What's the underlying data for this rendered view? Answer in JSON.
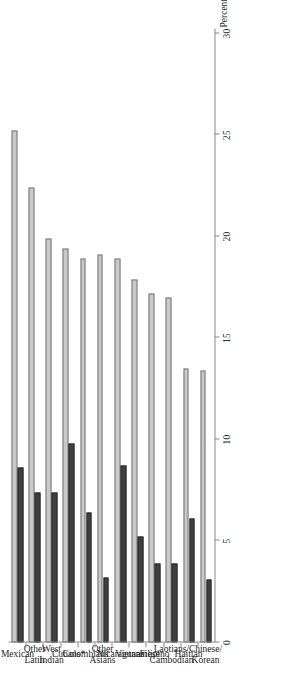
{
  "chart_data": {
    "type": "bar",
    "title": "",
    "xlabel": "",
    "ylabel": "Percent",
    "ylim": [
      0,
      30
    ],
    "yticks": [
      0,
      5,
      10,
      15,
      20,
      25,
      30
    ],
    "ytick_labels": [
      "0",
      "5",
      "10",
      "15",
      "20",
      "25",
      "30"
    ],
    "grid": false,
    "legend": "none",
    "orientation": "rotated-90-page-scan",
    "categories": [
      "Mexican",
      "Other\nLatin",
      "West\nIndian",
      "Cubans*",
      "Colombians",
      "Other\nAsians",
      "Nicaraguans",
      "Vietnamese",
      "Filipino",
      "Laotians/\nCambodian",
      "Haitian",
      "Chinese/\nKorean"
    ],
    "series": [
      {
        "name": "series-1",
        "color": "#c9c9c9",
        "values": [
          25.2,
          22.4,
          19.9,
          19.4,
          18.9,
          19.1,
          18.9,
          17.9,
          17.2,
          17.0,
          13.5,
          13.4
        ]
      },
      {
        "name": "series-2",
        "color": "#3f3f3f",
        "values": [
          8.6,
          7.4,
          7.4,
          9.8,
          6.4,
          3.2,
          8.7,
          5.2,
          3.9,
          3.9,
          6.1,
          3.1
        ]
      }
    ]
  },
  "axis": {
    "percent_label": "Percent"
  },
  "colors": {
    "series_1": "#c9c9c9",
    "series_2": "#3f3f3f",
    "axis": "#8a8a8a",
    "text": "#1e1e1e",
    "background": "#ffffff"
  }
}
